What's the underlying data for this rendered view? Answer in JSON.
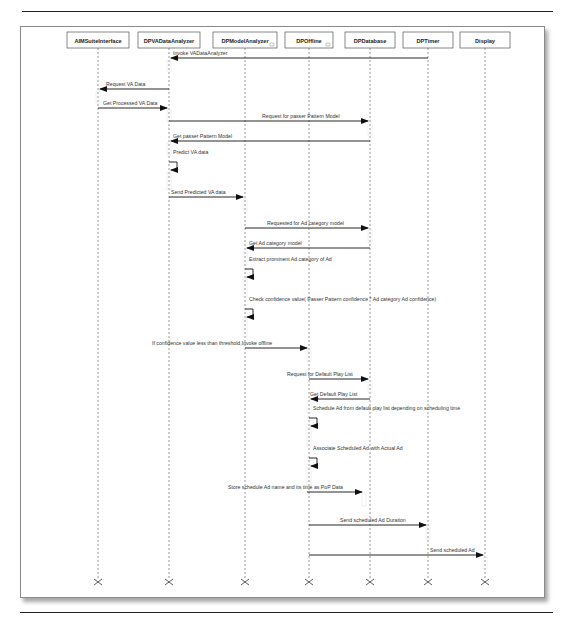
{
  "diagram": {
    "type": "uml-sequence-diagram",
    "lifelines": [
      {
        "id": "aim",
        "name": "AIMSuiteInterface",
        "x": 98,
        "box_w": 62,
        "subflag": false
      },
      {
        "id": "dpva",
        "name": "DPVADataAnalyzer",
        "x": 169,
        "box_w": 62,
        "subflag": false
      },
      {
        "id": "dpma",
        "name": "DPModelAnalyzer",
        "x": 245,
        "box_w": 64,
        "subflag": true
      },
      {
        "id": "dpoff",
        "name": "DPOffline",
        "x": 309,
        "box_w": 48,
        "subflag": true
      },
      {
        "id": "dpdb",
        "name": "DPDatabase",
        "x": 370,
        "box_w": 50,
        "subflag": false
      },
      {
        "id": "dpt",
        "name": "DPTimer",
        "x": 428,
        "box_w": 50,
        "subflag": false
      },
      {
        "id": "disp",
        "name": "Display",
        "x": 485,
        "box_w": 50,
        "subflag": false
      }
    ],
    "messages": [
      {
        "n": 1,
        "from": "dpt",
        "to": "dpva",
        "y": 58,
        "label": "Invoke VADataAnalyzer",
        "label_x": 173,
        "anchor": "start"
      },
      {
        "n": 2,
        "from": "dpva",
        "to": "aim",
        "y": 89,
        "label": "Request VA Data",
        "label_x": 106,
        "anchor": "start"
      },
      {
        "n": 3,
        "from": "aim",
        "to": "dpva",
        "y": 108,
        "label": "Get Processed VA Data",
        "label_x": 103,
        "anchor": "start"
      },
      {
        "n": 4,
        "from": "dpva",
        "to": "dpdb",
        "y": 121,
        "label": "Request for passer Pattern Model",
        "label_x": 262,
        "anchor": "start"
      },
      {
        "n": 5,
        "from": "dpdb",
        "to": "dpva",
        "y": 141,
        "label": "Get passer Pattern Model",
        "label_x": 173,
        "anchor": "start"
      },
      {
        "n": 6,
        "self": "dpva",
        "y": 157,
        "label": "Predict VA data",
        "label_x": 173,
        "anchor": "start"
      },
      {
        "n": 7,
        "from": "dpva",
        "to": "dpma",
        "y": 197,
        "label": "Send Predicted VA data",
        "label_x": 171,
        "anchor": "start"
      },
      {
        "n": 8,
        "from": "dpma",
        "to": "dpdb",
        "y": 228,
        "label": "Requested for Ad category model",
        "label_x": 267,
        "anchor": "start"
      },
      {
        "n": 9,
        "from": "dpdb",
        "to": "dpma",
        "y": 248,
        "label": "Get Ad category model",
        "label_x": 249,
        "anchor": "start"
      },
      {
        "n": 10,
        "self": "dpma",
        "y": 264,
        "label": "Extract prominent Ad category of Ad",
        "label_x": 249,
        "anchor": "start"
      },
      {
        "n": 11,
        "self": "dpma",
        "y": 304,
        "label": "Check confidence value( Passer Pattern confidence * Ad category Ad confidence)",
        "label_x": 249,
        "anchor": "start"
      },
      {
        "n": 12,
        "from": "dpma",
        "to": "dpoff",
        "y": 348,
        "label": "If confidence value less than threshold,Invoke offline",
        "label_x": 152,
        "anchor": "start"
      },
      {
        "n": 13,
        "from": "dpoff",
        "to": "dpdb",
        "y": 379,
        "label": "Request for Default Play List",
        "label_x": 287,
        "anchor": "start"
      },
      {
        "n": 14,
        "from": "dpdb",
        "to": "dpoff",
        "y": 399,
        "label": "Get Default Play List",
        "label_x": 310,
        "anchor": "start"
      },
      {
        "n": 15,
        "self": "dpoff",
        "y": 413,
        "label": "Schedule Ad from default play list depending on scheduling time",
        "label_x": 313,
        "anchor": "start"
      },
      {
        "n": 16,
        "self": "dpoff",
        "y": 453,
        "label": "Associate Scheduled Ad with Actual Ad",
        "label_x": 313,
        "anchor": "start"
      },
      {
        "n": 17,
        "from": "dpma",
        "to": "dpoff",
        "y": 492,
        "label": "Store schedule Ad name and its time as PoP Data",
        "label_x": 228,
        "anchor": "start",
        "note": "arrow starts at DPModelAnalyzer-side x=307, ends at DPDatabase lifeline area x=364"
      },
      {
        "n": 18,
        "from": "dpoff",
        "to": "dpt",
        "y": 525,
        "label": "Send scheduled Ad Duration",
        "label_x": 340,
        "anchor": "start"
      },
      {
        "n": 19,
        "from": "dpoff",
        "to": "disp",
        "y": 555,
        "label": "Send scheduled Ad",
        "label_x": 430,
        "anchor": "start"
      }
    ],
    "termination_y": 582
  },
  "chart_data": {
    "type": "table",
    "columns": [
      "#",
      "from",
      "to",
      "message"
    ],
    "rows": [
      [
        1,
        "DPTimer",
        "DPVADataAnalyzer",
        "Invoke VADataAnalyzer"
      ],
      [
        2,
        "DPVADataAnalyzer",
        "AIMSuiteInterface",
        "Request VA Data"
      ],
      [
        3,
        "AIMSuiteInterface",
        "DPVADataAnalyzer",
        "Get Processed VA Data"
      ],
      [
        4,
        "DPVADataAnalyzer",
        "DPDatabase",
        "Request for passer Pattern Model"
      ],
      [
        5,
        "DPDatabase",
        "DPVADataAnalyzer",
        "Get passer Pattern Model"
      ],
      [
        6,
        "DPVADataAnalyzer",
        "DPVADataAnalyzer",
        "Predict VA data"
      ],
      [
        7,
        "DPVADataAnalyzer",
        "DPModelAnalyzer",
        "Send Predicted VA data"
      ],
      [
        8,
        "DPModelAnalyzer",
        "DPDatabase",
        "Requested for Ad category model"
      ],
      [
        9,
        "DPDatabase",
        "DPModelAnalyzer",
        "Get Ad category model"
      ],
      [
        10,
        "DPModelAnalyzer",
        "DPModelAnalyzer",
        "Extract prominent Ad category of Ad"
      ],
      [
        11,
        "DPModelAnalyzer",
        "DPModelAnalyzer",
        "Check confidence value( Passer Pattern confidence * Ad category Ad confidence)"
      ],
      [
        12,
        "DPModelAnalyzer",
        "DPOffline",
        "If confidence value less than threshold,Invoke offline"
      ],
      [
        13,
        "DPOffline",
        "DPDatabase",
        "Request for Default Play List"
      ],
      [
        14,
        "DPDatabase",
        "DPOffline",
        "Get Default Play List"
      ],
      [
        15,
        "DPOffline",
        "DPOffline",
        "Schedule Ad from default play list depending on scheduling time"
      ],
      [
        16,
        "DPOffline",
        "DPOffline",
        "Associate Scheduled Ad with Actual Ad"
      ],
      [
        17,
        "DPOffline",
        "DPDatabase",
        "Store schedule Ad name and its time as PoP Data"
      ],
      [
        18,
        "DPOffline",
        "DPTimer",
        "Send scheduled Ad Duration"
      ],
      [
        19,
        "DPOffline",
        "Display",
        "Send scheduled Ad"
      ]
    ]
  },
  "colors": {
    "line": "#222222",
    "lifeline": "#555555",
    "frame_border": "#8a8a8a",
    "activation": "#e6e6e6"
  }
}
